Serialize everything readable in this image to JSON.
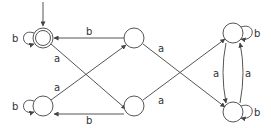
{
  "diagram": {
    "type": "finite-automaton",
    "colors": {
      "stroke": "#555555",
      "text": "#333333",
      "background": "#ffffff"
    },
    "states": [
      {
        "id": "q0",
        "x": 43,
        "y": 38,
        "start": true,
        "accepting": true
      },
      {
        "id": "q1",
        "x": 43,
        "y": 106,
        "start": false,
        "accepting": false
      },
      {
        "id": "q2",
        "x": 134,
        "y": 38,
        "start": false,
        "accepting": false
      },
      {
        "id": "q3",
        "x": 134,
        "y": 106,
        "start": false,
        "accepting": false
      },
      {
        "id": "q4",
        "x": 233,
        "y": 33,
        "start": false,
        "accepting": false
      },
      {
        "id": "q5",
        "x": 233,
        "y": 112,
        "start": false,
        "accepting": false
      }
    ],
    "transitions": [
      {
        "from": "q0",
        "to": "q0",
        "label": "b"
      },
      {
        "from": "q1",
        "to": "q1",
        "label": "b"
      },
      {
        "from": "q2",
        "to": "q0",
        "label": "b"
      },
      {
        "from": "q3",
        "to": "q1",
        "label": "b"
      },
      {
        "from": "q0",
        "to": "q3",
        "label": "a"
      },
      {
        "from": "q1",
        "to": "q2",
        "label": "a"
      },
      {
        "from": "q2",
        "to": "q5",
        "label": "a"
      },
      {
        "from": "q3",
        "to": "q4",
        "label": "a"
      },
      {
        "from": "q4",
        "to": "q5",
        "label": "a"
      },
      {
        "from": "q5",
        "to": "q4",
        "label": "a"
      },
      {
        "from": "q4",
        "to": "q4",
        "label": "b"
      },
      {
        "from": "q5",
        "to": "q5",
        "label": "b"
      }
    ]
  }
}
